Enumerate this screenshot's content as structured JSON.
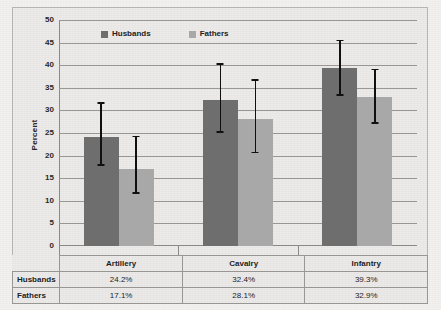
{
  "chart_data": {
    "type": "bar",
    "title": "",
    "xlabel": "",
    "ylabel": "Percent",
    "ylim": [
      0,
      50
    ],
    "ytick_step": 5,
    "yticks": [
      0,
      5,
      10,
      15,
      20,
      25,
      30,
      35,
      40,
      45,
      50
    ],
    "ytick_labels": [
      "0",
      "5",
      "10",
      "15",
      "20",
      "25",
      "30",
      "35",
      "40",
      "45",
      "50"
    ],
    "grid": true,
    "grid_axis": "y",
    "legend_position": "top-left-inside",
    "categories": [
      "Artillery",
      "Cavalry",
      "Infantry"
    ],
    "series": [
      {
        "name": "Husbands",
        "color": "#6e6e6e",
        "values": [
          24.2,
          32.4,
          39.3
        ],
        "value_labels": [
          "24.2%",
          "32.4%",
          "39.3%"
        ],
        "error_low": [
          17.8,
          25.0,
          33.2
        ],
        "error_high": [
          31.8,
          40.5,
          45.6
        ]
      },
      {
        "name": "Fathers",
        "color": "#a8a8a8",
        "values": [
          17.1,
          28.1,
          32.9
        ],
        "value_labels": [
          "17.1%",
          "28.1%",
          "32.9%"
        ],
        "error_low": [
          11.6,
          20.5,
          27.0
        ],
        "error_high": [
          24.4,
          36.9,
          39.2
        ]
      }
    ]
  },
  "legend": {
    "items": [
      {
        "label": "Husbands",
        "color": "#6e6e6e"
      },
      {
        "label": "Fathers",
        "color": "#a8a8a8"
      }
    ]
  },
  "axis": {
    "ylabel": "Percent",
    "ytick_labels": [
      "50",
      "45",
      "40",
      "35",
      "30",
      "25",
      "20",
      "15",
      "10",
      "5",
      "0"
    ]
  },
  "table": {
    "row_headers": [
      "Husbands",
      "Fathers"
    ],
    "column_headers": [
      "Artillery",
      "Cavalry",
      "Infantry"
    ],
    "rows": [
      {
        "header": "Husbands",
        "cells": [
          "24.2%",
          "32.4%",
          "39.3%"
        ]
      },
      {
        "header": "Fathers",
        "cells": [
          "17.1%",
          "28.1%",
          "32.9%"
        ]
      }
    ]
  },
  "colors": {
    "husbands_bar": "#6e6e6e",
    "fathers_bar": "#a8a8a8",
    "error_bar": "#101010",
    "grid": "#9b9996",
    "figure_background": "#ecebe9",
    "page_background": "#f2f1ef",
    "frame_border": "#b9b7b4"
  }
}
